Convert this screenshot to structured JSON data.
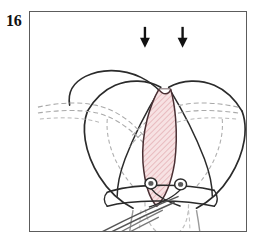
{
  "figure": {
    "number": "16",
    "caption_fragment_above": "",
    "frame": {
      "border_color": "#5c5c5c",
      "background": "#ffffff"
    }
  },
  "illustration": {
    "title": "surgical-line-drawing-uterus-wedge-resection",
    "type": "medical-line-drawing",
    "line_color": "#2b2b2b",
    "secondary_line_color": "#9a9a9a",
    "dashed_line_color": "#a9a9a9",
    "wedge": {
      "name": "excised-wedge",
      "fill_color": "#f6dfe0",
      "hatch_color": "#d98f96",
      "outline_color": "#4a3034",
      "label": "wedge resection area"
    },
    "arrows": {
      "name": "direction-arrows",
      "color": "#111111",
      "count": 2,
      "direction": "down",
      "label": "incision direction arrows"
    },
    "ligature": {
      "name": "ligature-band",
      "color": "#2b2b2b",
      "knot_color": "#4a4a4a",
      "knot_count": 2,
      "label": "ligature with knots"
    },
    "sutures": {
      "name": "suture-strands",
      "color": "#555555",
      "label": "suture strands"
    },
    "cervix": {
      "name": "cervical-canal",
      "color": "#9a9a9a",
      "label": "cervix"
    },
    "tubes": {
      "name": "fallopian-tubes",
      "color": "#9a9a9a",
      "label": "fallopian tubes"
    }
  }
}
